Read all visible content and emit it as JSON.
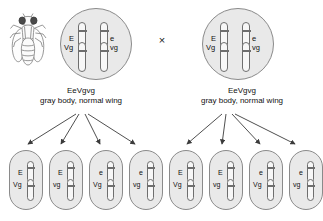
{
  "diagram": {
    "cross_symbol": "×",
    "colors": {
      "cell_fill": "#e9e9e9",
      "cell_stroke": "#8a8a8a",
      "chromosome_fill": "#f7f7f7",
      "chromosome_stroke": "#6e6e6e",
      "text": "#111111",
      "background": "#ffffff"
    }
  },
  "parents": [
    {
      "side": "left",
      "fly_icon": "fruit-fly-icon",
      "genotype": "EeVgvg",
      "phenotype": "gray body, normal wing",
      "chromosomes": [
        {
          "allele": "E",
          "position": "upper-left"
        },
        {
          "allele": "e",
          "position": "upper-right"
        },
        {
          "allele": "Vg",
          "position": "lower-left"
        },
        {
          "allele": "vg",
          "position": "lower-right"
        }
      ]
    },
    {
      "side": "right",
      "fly_icon": "fruit-fly-icon",
      "genotype": "EeVgvg",
      "phenotype": "gray body, normal wing",
      "chromosomes": [
        {
          "allele": "E",
          "position": "upper-left"
        },
        {
          "allele": "e",
          "position": "upper-right"
        },
        {
          "allele": "Vg",
          "position": "lower-left"
        },
        {
          "allele": "vg",
          "position": "lower-right"
        }
      ]
    }
  ],
  "gametes": {
    "left": [
      {
        "top_allele": "E",
        "bottom_allele": "Vg"
      },
      {
        "top_allele": "E",
        "bottom_allele": "vg"
      },
      {
        "top_allele": "e",
        "bottom_allele": "Vg"
      },
      {
        "top_allele": "e",
        "bottom_allele": "vg"
      }
    ],
    "right": [
      {
        "top_allele": "E",
        "bottom_allele": "Vg"
      },
      {
        "top_allele": "E",
        "bottom_allele": "vg"
      },
      {
        "top_allele": "e",
        "bottom_allele": "Vg"
      },
      {
        "top_allele": "e",
        "bottom_allele": "vg"
      }
    ]
  }
}
